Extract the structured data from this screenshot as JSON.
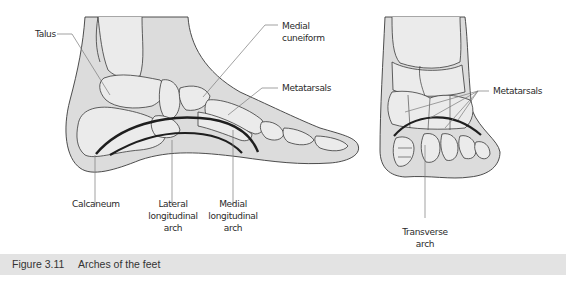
{
  "figure": {
    "number": "Figure 3.11",
    "caption": "Arches of the feet"
  },
  "side_view": {
    "labels": {
      "talus": "Talus",
      "medial_cuneiform": "Medial\ncuneiform",
      "metatarsals": "Metatarsals",
      "calcaneum": "Calcaneum",
      "lateral_arch": "Lateral\nlongitudinal\narch",
      "medial_arch": "Medial\nlongitudinal\narch"
    }
  },
  "front_view": {
    "labels": {
      "metatarsals": "Metatarsals",
      "transverse_arch": "Transverse\narch"
    }
  },
  "colors": {
    "skin": "#dcdcdc",
    "bone": "#ebebeb",
    "outline": "#3a3a3a",
    "arch": "#1e1e1e",
    "leader": "#7a7a7a",
    "caption_bar": "#e3e3e3"
  }
}
